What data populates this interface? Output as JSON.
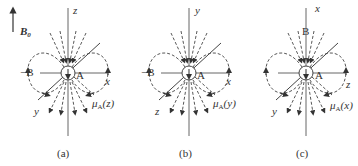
{
  "field": {
    "symbol": "B",
    "subscript": "0"
  },
  "panels": [
    {
      "caption": "(a)",
      "axis_top": "z",
      "axis_right": "x",
      "axis_diag": "y",
      "left_label": "−B",
      "top_label": "",
      "center_label": "A",
      "moment_symbol": "μ",
      "moment_sub": "A",
      "moment_arg": "(z)"
    },
    {
      "caption": "(b)",
      "axis_top": "y",
      "axis_right": "x",
      "axis_diag": "z",
      "left_label": "−B",
      "top_label": "",
      "center_label": "A",
      "moment_symbol": "μ",
      "moment_sub": "A",
      "moment_arg": "(y)"
    },
    {
      "caption": "(c)",
      "axis_top": "x",
      "axis_right": "z",
      "axis_diag": "y",
      "left_label": "",
      "top_label": "B",
      "center_label": "A",
      "moment_symbol": "μ",
      "moment_sub": "A",
      "moment_arg": "(x)"
    }
  ],
  "colors": {
    "line": "#555555",
    "dashed": "#444444",
    "text": "#333333"
  }
}
